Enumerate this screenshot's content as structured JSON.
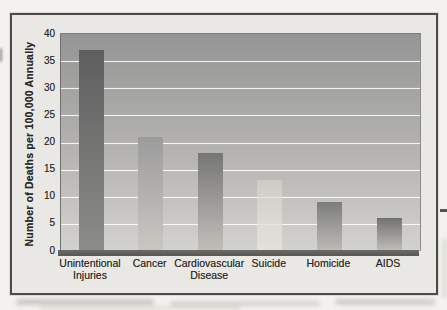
{
  "figure_kind": "scanned-textbook-bar-chart",
  "chart_data": {
    "type": "bar",
    "title": "",
    "xlabel": "",
    "ylabel": "Number of Deaths per 100,000 Annually",
    "categories": [
      "Unintentional Injuries",
      "Cancer",
      "Cardiovascular Disease",
      "Suicide",
      "Homicide",
      "AIDS"
    ],
    "category_lines": [
      [
        "Unintentional",
        "Injuries"
      ],
      [
        "Cancer"
      ],
      [
        "Cardiovascular",
        "Disease"
      ],
      [
        "Suicide"
      ],
      [
        "Homicide"
      ],
      [
        "AIDS"
      ]
    ],
    "values": [
      37,
      21,
      18,
      13,
      9,
      6
    ],
    "ylim": [
      0,
      40
    ],
    "ytick_step": 5,
    "yticks": [
      0,
      5,
      10,
      15,
      20,
      25,
      30,
      35,
      40
    ],
    "grid": true,
    "gridline_color": "#faf9f7",
    "legend": false,
    "plot_bg_gradient": [
      "#959595",
      "#d4d2ce"
    ],
    "axis_band_color": "#5f5f5c",
    "bar_gradients": [
      [
        "#5e5e5e",
        "#8c8c8a"
      ],
      [
        "#9c9c9c",
        "#cac7c2"
      ],
      [
        "#767676",
        "#c2bfba"
      ],
      [
        "rgba(218,215,210,0.55)",
        "rgba(230,227,222,0.85)"
      ],
      [
        "#7d7d7d",
        "#bebbb6"
      ],
      [
        "#727272",
        "#c1beb9"
      ]
    ]
  }
}
